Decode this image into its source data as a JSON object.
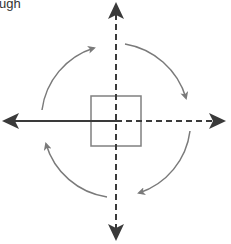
{
  "caption": {
    "text": "ugh"
  },
  "colors": {
    "axis": "#3a3a3a",
    "arc": "#7a7a7a",
    "square": "#808080",
    "background": "#ffffff",
    "text": "#333333"
  },
  "diagram": {
    "center": [
      116,
      121
    ],
    "square": {
      "x": 91,
      "y": 96,
      "size": 50
    },
    "axes": [
      {
        "name": "left-axis",
        "style": "solid",
        "direction": "left"
      },
      {
        "name": "right-axis",
        "style": "dashed",
        "direction": "right"
      },
      {
        "name": "up-axis",
        "style": "dashed",
        "direction": "up"
      },
      {
        "name": "down-axis",
        "style": "dashed",
        "direction": "down"
      }
    ],
    "rotation_arrows": [
      {
        "name": "arc-top-left",
        "direction": "clockwise"
      },
      {
        "name": "arc-top-right",
        "direction": "clockwise"
      },
      {
        "name": "arc-bottom-right",
        "direction": "clockwise"
      },
      {
        "name": "arc-bottom-left",
        "direction": "clockwise"
      }
    ]
  }
}
